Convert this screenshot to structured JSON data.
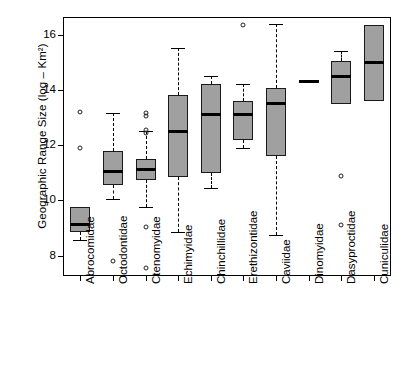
{
  "chart_data": {
    "type": "box",
    "title": "",
    "xlabel": "",
    "ylabel": "Geographic Range Size (log – Km²)",
    "ylim": [
      7.3,
      16.6
    ],
    "yticks": [
      8,
      10,
      12,
      14,
      16
    ],
    "ytick_labels": [
      "8",
      "10",
      "12",
      "14",
      "16"
    ],
    "grid": false,
    "legend": "none",
    "categories": [
      "Abrocomidae",
      "Octodontidae",
      "Ctenomyidae",
      "Echimyidae",
      "Chinchillidae",
      "Erethizontidae",
      "Caviidae",
      "Dinomyidae",
      "Dasyproctidae",
      "Cuniculidae"
    ],
    "boxes": [
      {
        "category": "Abrocomidae",
        "whisker_low": 8.55,
        "q1": 8.85,
        "median": 9.12,
        "q3": 9.75,
        "whisker_high": 9.75,
        "outliers": [
          11.9,
          13.2
        ]
      },
      {
        "category": "Octodontidae",
        "whisker_low": 10.05,
        "q1": 10.55,
        "median": 11.05,
        "q3": 11.8,
        "whisker_high": 13.15,
        "outliers": [
          7.8
        ]
      },
      {
        "category": "Ctenomyidae",
        "whisker_low": 9.75,
        "q1": 10.75,
        "median": 11.1,
        "q3": 11.5,
        "whisker_high": 12.5,
        "outliers": [
          7.55,
          9.05,
          12.45,
          12.55,
          13.05,
          13.15
        ]
      },
      {
        "category": "Echimyidae",
        "whisker_low": 8.85,
        "q1": 10.85,
        "median": 12.5,
        "q3": 13.8,
        "whisker_high": 15.5,
        "outliers": []
      },
      {
        "category": "Chinchillidae",
        "whisker_low": 10.45,
        "q1": 11.0,
        "median": 13.1,
        "q3": 14.2,
        "whisker_high": 14.5,
        "outliers": []
      },
      {
        "category": "Erethizontidae",
        "whisker_low": 11.9,
        "q1": 12.2,
        "median": 13.1,
        "q3": 13.6,
        "whisker_high": 14.2,
        "outliers": [
          16.35
        ]
      },
      {
        "category": "Caviidae",
        "whisker_low": 8.75,
        "q1": 11.6,
        "median": 13.5,
        "q3": 14.05,
        "whisker_high": 16.4,
        "outliers": []
      },
      {
        "category": "Dinomyidae",
        "whisker_low": 14.3,
        "q1": 14.3,
        "median": 14.3,
        "q3": 14.3,
        "whisker_high": 14.3,
        "outliers": []
      },
      {
        "category": "Dasyproctidae",
        "whisker_low": 13.5,
        "q1": 13.5,
        "median": 14.5,
        "q3": 15.05,
        "whisker_high": 15.4,
        "outliers": [
          9.1,
          10.9
        ]
      },
      {
        "category": "Cuniculidae",
        "whisker_low": 13.6,
        "q1": 13.6,
        "median": 15.0,
        "q3": 16.35,
        "whisker_high": 16.35,
        "outliers": []
      }
    ]
  }
}
